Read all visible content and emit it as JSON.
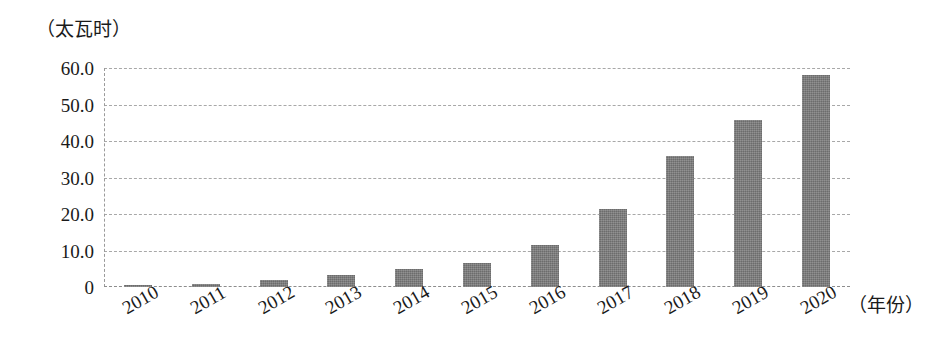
{
  "chart_data": {
    "type": "bar",
    "title": "",
    "subtitle": "",
    "xlabel": "（年份）",
    "ylabel": "（太瓦时）",
    "categories": [
      "2010",
      "2011",
      "2012",
      "2013",
      "2014",
      "2015",
      "2016",
      "2017",
      "2018",
      "2019",
      "2020"
    ],
    "values": [
      0.5,
      0.8,
      2.0,
      3.4,
      4.8,
      6.5,
      11.5,
      21.3,
      36.0,
      45.8,
      58.0
    ],
    "ylim": [
      0,
      60
    ],
    "y_ticks": [
      0,
      10,
      20,
      30,
      40,
      50,
      60
    ],
    "y_tick_labels": [
      "0",
      "10.0",
      "20.0",
      "30.0",
      "40.0",
      "50.0",
      "60.0"
    ],
    "grid": true,
    "grid_style": "dashed",
    "legend": "none",
    "bar_color": "#787878",
    "axis_color": "#8d8d8d",
    "grid_color": "#a8a8a8",
    "text_color": "#1a1a1a",
    "x_tick_rotation": -30
  }
}
